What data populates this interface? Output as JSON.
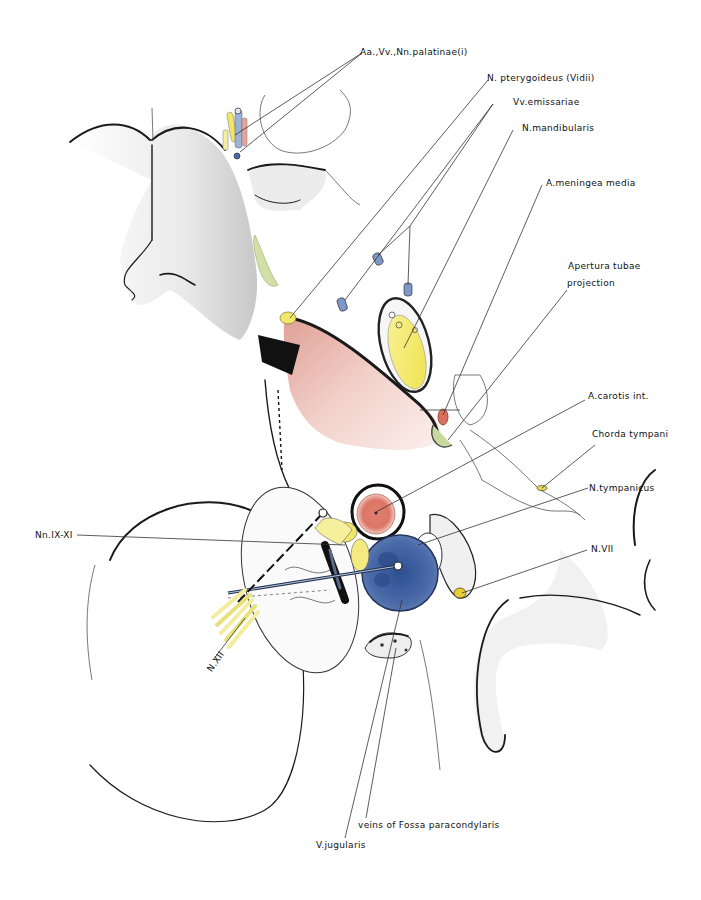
{
  "figure": {
    "type": "anatomical illustration"
  },
  "colors": {
    "artery": "#d8786a",
    "vein": "#3f5f9e",
    "nerve": "#f2e66a",
    "bone_shadow": "#6b6b6b",
    "mucosa": "#e2a79c",
    "green_tissue": "#c7d79c"
  },
  "labels": [
    {
      "id": "palatinae",
      "text": "Aa.,Vv.,Nn.palatinae(i)"
    },
    {
      "id": "pterygoideus",
      "text": "N. pterygoideus (Vidii)"
    },
    {
      "id": "emissariae",
      "text": "Vv.emissariae"
    },
    {
      "id": "mandibularis",
      "text": "N.mandibularis"
    },
    {
      "id": "meningea",
      "text": "A.meningea media"
    },
    {
      "id": "apertura_1",
      "text": "Apertura tubae"
    },
    {
      "id": "apertura_2",
      "text": "projection"
    },
    {
      "id": "carotis",
      "text": "A.carotis int."
    },
    {
      "id": "chorda",
      "text": "Chorda tympani"
    },
    {
      "id": "tympanicus",
      "text": "N.tympanicus"
    },
    {
      "id": "nn_ix_xi",
      "text": "Nn.IX-XI"
    },
    {
      "id": "n_vii",
      "text": "N.VII"
    },
    {
      "id": "n_xii",
      "text": "N.XII"
    },
    {
      "id": "fossa",
      "text": "veins of Fossa paracondylaris"
    },
    {
      "id": "jugularis",
      "text": "V.jugularis"
    }
  ]
}
